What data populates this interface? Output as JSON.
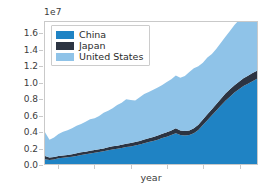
{
  "chart_data": {
    "type": "area",
    "stacked": true,
    "title": "",
    "subtitle": "",
    "xlabel": "year",
    "ylabel": "",
    "y_offset_text": "1e7",
    "y_offset_factor": 10000000,
    "xlim": [
      0,
      47
    ],
    "ylim": [
      0,
      17500000
    ],
    "ytick_labels": [
      "0.0",
      "0.2",
      "0.4",
      "0.6",
      "0.8",
      "1.0",
      "1.2",
      "1.4",
      "1.6"
    ],
    "ytick_values": [
      0,
      2000000,
      4000000,
      6000000,
      8000000,
      10000000,
      12000000,
      14000000,
      16000000
    ],
    "xtick_labels": [
      "",
      "",
      "",
      "",
      "",
      ""
    ],
    "xtick_positions": [
      3,
      11,
      19,
      27,
      35,
      43
    ],
    "grid": false,
    "legend_position": "upper left",
    "x": [
      0,
      1,
      2,
      3,
      4,
      5,
      6,
      7,
      8,
      9,
      10,
      11,
      12,
      13,
      14,
      15,
      16,
      17,
      18,
      19,
      20,
      21,
      22,
      23,
      24,
      25,
      26,
      27,
      28,
      29,
      30,
      31,
      32,
      33,
      34,
      35,
      36,
      37,
      38,
      39,
      40,
      41,
      42,
      43,
      44,
      45,
      46,
      47
    ],
    "series": [
      {
        "name": "China",
        "color": "#1f83c4",
        "values": [
          600000,
          480000,
          560000,
          700000,
          760000,
          820000,
          900000,
          1000000,
          1120000,
          1200000,
          1300000,
          1400000,
          1480000,
          1560000,
          1700000,
          1800000,
          1880000,
          1960000,
          2080000,
          2160000,
          2280000,
          2400000,
          2560000,
          2700000,
          2840000,
          3000000,
          3200000,
          3360000,
          3560000,
          3800000,
          3560000,
          3500000,
          3560000,
          3800000,
          4200000,
          4800000,
          5400000,
          6000000,
          6600000,
          7200000,
          7800000,
          8300000,
          8800000,
          9200000,
          9600000,
          9900000,
          10200000,
          10500000
        ]
      },
      {
        "name": "Japan",
        "color": "#2c3442",
        "values": [
          400000,
          320000,
          300000,
          300000,
          300000,
          300000,
          300000,
          320000,
          320000,
          320000,
          320000,
          340000,
          340000,
          360000,
          360000,
          380000,
          380000,
          400000,
          400000,
          420000,
          440000,
          440000,
          460000,
          480000,
          500000,
          520000,
          540000,
          560000,
          580000,
          600000,
          560000,
          560000,
          580000,
          600000,
          640000,
          680000,
          720000,
          760000,
          800000,
          840000,
          880000,
          900000,
          920000,
          940000,
          960000,
          980000,
          1000000,
          1000000
        ]
      },
      {
        "name": "United States",
        "color": "#8fc3e8",
        "values": [
          2900000,
          2200000,
          2400000,
          2700000,
          2900000,
          3050000,
          3200000,
          3380000,
          3500000,
          3700000,
          3900000,
          3900000,
          4100000,
          4400000,
          4500000,
          4700000,
          5000000,
          5200000,
          5500000,
          5300000,
          5100000,
          5400000,
          5600000,
          5700000,
          5800000,
          5900000,
          6000000,
          6200000,
          6300000,
          6500000,
          6500000,
          6800000,
          7200000,
          7400000,
          7200000,
          7000000,
          7000000,
          6800000,
          6800000,
          6900000,
          7000000,
          7200000,
          7400000,
          7600000,
          7400000,
          7000000,
          6600000,
          6400000
        ]
      }
    ],
    "legend_entries": [
      {
        "label": "China",
        "color": "#1f83c4"
      },
      {
        "label": "Japan",
        "color": "#2c3442"
      },
      {
        "label": "United States",
        "color": "#8fc3e8"
      }
    ]
  }
}
